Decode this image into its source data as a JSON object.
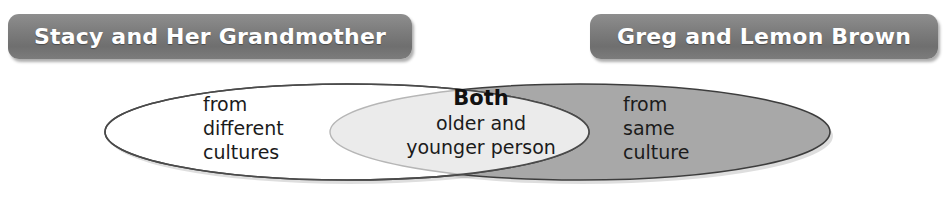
{
  "diagram": {
    "type": "venn-two-set",
    "title_left": "Stacy and Her Grandmother",
    "title_right": "Greg and Lemon Brown",
    "left_only": "from\ndifferent\ncultures",
    "left_only_lines": [
      "from",
      "different",
      "cultures"
    ],
    "right_only": "from\nsame\nculture",
    "right_only_lines": [
      "from",
      "same",
      "culture"
    ],
    "both_heading": "Both",
    "both_lines": [
      "older and",
      "younger person"
    ],
    "colors": {
      "banner_fill": "#7e7e7e",
      "banner_text": "#ffffff",
      "left_ellipse_fill": "#ffffff",
      "right_ellipse_fill": "#a8a8a8",
      "overlap_fill": "#ebebeb",
      "outline": "#4a4a4a",
      "text": "#1b1b1b",
      "page_background": "#ffffff"
    }
  },
  "banners": {
    "left": {
      "label": "Stacy and Her Grandmother"
    },
    "right": {
      "label": "Greg and Lemon Brown"
    }
  },
  "regions": {
    "left": {
      "line1": "from",
      "line2": "different",
      "line3": "cultures"
    },
    "overlap": {
      "heading": "Both",
      "line1": "older and",
      "line2": "younger person"
    },
    "right": {
      "line1": "from",
      "line2": "same",
      "line3": "culture"
    }
  }
}
